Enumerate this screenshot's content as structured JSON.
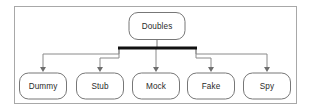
{
  "diagram": {
    "title": "Doubles",
    "type": "hierarchy-tree",
    "root": {
      "label": "Doubles",
      "x": 157,
      "y": 26,
      "w": 56,
      "h": 27
    },
    "bus": {
      "label": "generalization-bar",
      "x1": 118,
      "x2": 197,
      "y": 48,
      "thickness": 3,
      "color": "#111111"
    },
    "children": [
      {
        "label": "Dummy",
        "x": 43,
        "y": 86,
        "w": 47,
        "h": 26
      },
      {
        "label": "Stub",
        "x": 100,
        "y": 86,
        "w": 47,
        "h": 26
      },
      {
        "label": "Mock",
        "x": 156,
        "y": 86,
        "w": 47,
        "h": 26
      },
      {
        "label": "Fake",
        "x": 211,
        "y": 86,
        "w": 47,
        "h": 26
      },
      {
        "label": "Spy",
        "x": 267,
        "y": 86,
        "w": 47,
        "h": 26
      }
    ],
    "colors": {
      "frame_border": "#a8a8a8",
      "node_border": "#777777",
      "node_fill": "#ffffff",
      "connector": "#8a8a8a",
      "bar": "#111111",
      "text": "#2b2b2b",
      "background": "#ffffff"
    }
  }
}
